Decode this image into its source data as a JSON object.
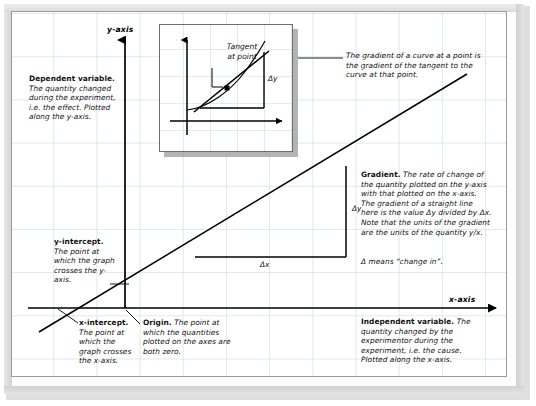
{
  "figure": {
    "axes": {
      "y_axis_label": "y-axis",
      "x_axis_label": "x-axis"
    },
    "delta_labels": {
      "delta_y": "Δy",
      "delta_x": "Δx",
      "inset_delta_y": "Δy"
    },
    "inset": {
      "tangent_label_line1": "Tangent",
      "tangent_label_line2": "at point",
      "callout": "The gradient of a curve at a point is the gradient of the tangent to the curve at that point."
    },
    "annotations": {
      "dependent_variable": {
        "heading": "Dependent variable.",
        "body": "The quantity changed during the experiment, i.e. the effect. Plotted along the y-axis."
      },
      "independent_variable": {
        "heading": "Independent variable.",
        "body": "The quantity changed by the experimentor during the experiment, i.e. the cause. Plotted along the x-axis."
      },
      "y_intercept": {
        "heading": "y-intercept.",
        "body": "The point at which the graph crosses the y-axis."
      },
      "x_intercept": {
        "heading": "x-intercept.",
        "body": "The point at which the graph crosses the x-axis."
      },
      "origin": {
        "heading": "Origin.",
        "body": "The point at which the quantities plotted on the axes are both zero."
      },
      "gradient": {
        "heading": "Gradient.",
        "body": "The rate of change of the quantity plotted on the y-axis with that plotted on the x-axis. The gradient of a straight line here is the value Δy divided by Δx. Note that the units of the gradient are the units of the quantity y/x.",
        "footnote": "Δ means “change in”."
      }
    },
    "colors": {
      "grid_line": "#dfe6ee",
      "ink": "#000000",
      "paper": "#ffffff",
      "frame": "#c9c9c9",
      "inset_border": "#6d6d6d"
    }
  }
}
